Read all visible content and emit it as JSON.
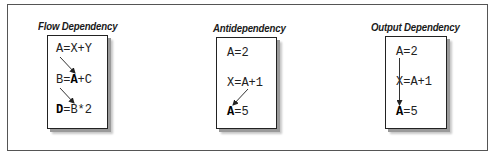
{
  "diagram": {
    "panels": [
      {
        "title": "Flow Dependency",
        "statements": [
          {
            "parts": [
              {
                "text": "A",
                "bold": false
              },
              {
                "text": "=X+Y",
                "bold": false
              }
            ]
          },
          {
            "parts": [
              {
                "text": "B=",
                "bold": false
              },
              {
                "text": "A",
                "bold": true
              },
              {
                "text": "+C",
                "bold": false
              }
            ]
          },
          {
            "parts": [
              {
                "text": "D",
                "bold": true
              },
              {
                "text": "=B*2",
                "bold": false
              }
            ]
          }
        ],
        "arrows": [
          {
            "from": "A=X+Y (A)",
            "to": "B=A+C (A)"
          },
          {
            "from": "B=A+C (B)",
            "to": "D=B*2 (B)"
          }
        ]
      },
      {
        "title": "Antidependency",
        "statements": [
          {
            "parts": [
              {
                "text": "A=2",
                "bold": false
              }
            ]
          },
          {
            "parts": [
              {
                "text": "X=A+1",
                "bold": false
              }
            ]
          },
          {
            "parts": [
              {
                "text": "A",
                "bold": true
              },
              {
                "text": "=5",
                "bold": false
              }
            ]
          }
        ],
        "arrows": [
          {
            "from": "X=A+1 (A)",
            "to": "A=5 (A)"
          }
        ]
      },
      {
        "title": "Output Dependency",
        "statements": [
          {
            "parts": [
              {
                "text": "A=2",
                "bold": false
              }
            ]
          },
          {
            "parts": [
              {
                "text": "X=A+1",
                "bold": false
              }
            ]
          },
          {
            "parts": [
              {
                "text": "A",
                "bold": true
              },
              {
                "text": "=5",
                "bold": false
              }
            ]
          }
        ],
        "arrows": [
          {
            "from": "A=2 (A)",
            "to": "A=5 (A)"
          }
        ]
      }
    ],
    "colors": {
      "frame": "#555555",
      "card_border": "#222222",
      "shadow": "#9a9a9a",
      "text": "#222222"
    }
  }
}
